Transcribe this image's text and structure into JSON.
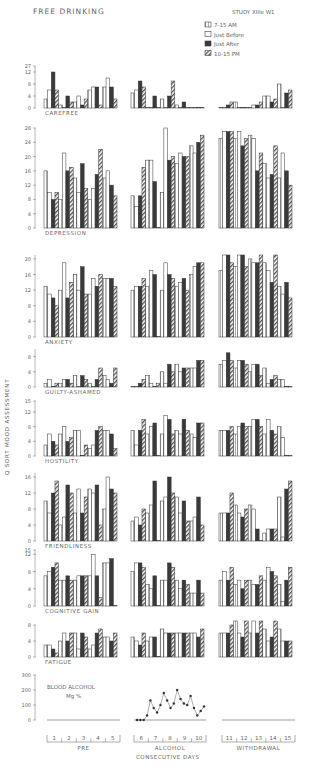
{
  "title": "FREE DRINKING",
  "study_label": "STUDY XIIIe W1",
  "y_axis_label": "Q SORT MOOD ASSESSMENT",
  "legend": [
    {
      "label": "7-15 AM",
      "style": "dotted"
    },
    {
      "label": "Just Before",
      "style": "open"
    },
    {
      "label": "Just After",
      "style": "solid"
    },
    {
      "label": "10-15 PM",
      "style": "hatched"
    }
  ],
  "phases": [
    {
      "label": "PRE",
      "days": [
        "1",
        "2",
        "3",
        "4",
        "5"
      ]
    },
    {
      "label": "ALCOHOL",
      "days": [
        "6",
        "7",
        "8",
        "9",
        "10"
      ]
    },
    {
      "label": "WITHDRAWAL",
      "days": [
        "11",
        "12",
        "13",
        "14",
        "15"
      ]
    }
  ],
  "x_axis_label": "CONSECUTIVE DAYS",
  "blood_alcohol": {
    "label": "BLOOD ALCOHOL",
    "unit": "Mg %",
    "ticks": [
      "0",
      "100",
      "200",
      "300"
    ]
  },
  "chart_data": {
    "type": "bar",
    "title": "FREE DRINKING",
    "ylabel": "Q SORT MOOD ASSESSMENT",
    "xlabel": "CONSECUTIVE DAYS",
    "series_names": [
      "7-15 AM",
      "Just Before",
      "Just After",
      "10-15 PM"
    ],
    "categories": [
      "1",
      "2",
      "3",
      "4",
      "5",
      "6",
      "7",
      "8",
      "9",
      "10",
      "11",
      "12",
      "13",
      "14",
      "15"
    ],
    "panels": [
      {
        "name": "CAREFREE",
        "ticks": [
          "0",
          "4",
          "8",
          "12",
          "27"
        ],
        "ylim": [
          0,
          14
        ],
        "values": [
          [
            3,
            6,
            12,
            6
          ],
          [
            1,
            0,
            4,
            2
          ],
          [
            2,
            4,
            1,
            3
          ],
          [
            6,
            7,
            7,
            1
          ],
          [
            7,
            10,
            7,
            3
          ],
          [
            5,
            6,
            9,
            7
          ],
          [
            0,
            0,
            4,
            0
          ],
          [
            3,
            0,
            4,
            9
          ],
          [
            1,
            0,
            2,
            0
          ],
          [
            0,
            0,
            0,
            0
          ],
          [
            0,
            0,
            1,
            2
          ],
          [
            2,
            0,
            0,
            0
          ],
          [
            0,
            1,
            1,
            2
          ],
          [
            4,
            4,
            2,
            3
          ],
          [
            8,
            0,
            5,
            6
          ]
        ]
      },
      {
        "name": "DEPRESSION",
        "ticks": [
          "0",
          "4",
          "8",
          "12",
          "16",
          "20",
          "24",
          "28"
        ],
        "ylim": [
          0,
          28
        ],
        "values": [
          [
            16,
            10,
            8,
            10
          ],
          [
            8,
            21,
            16,
            17
          ],
          [
            14,
            10,
            18,
            11
          ],
          [
            8,
            11,
            15,
            22
          ],
          [
            14,
            16,
            12,
            9
          ],
          [
            9,
            6,
            9,
            17
          ],
          [
            19,
            19,
            13,
            0
          ],
          [
            10,
            28,
            19,
            20
          ],
          [
            18,
            21,
            20,
            20
          ],
          [
            23,
            21,
            24,
            26
          ],
          [
            25,
            27,
            27,
            27
          ],
          [
            25,
            27,
            23,
            25
          ],
          [
            26,
            25,
            16,
            21
          ],
          [
            18,
            14,
            15,
            23
          ],
          [
            14,
            21,
            16,
            12
          ]
        ]
      },
      {
        "name": "ANXIETY",
        "ticks": [
          "0",
          "4",
          "8",
          "12",
          "16",
          "20"
        ],
        "ylim": [
          0,
          21
        ],
        "values": [
          [
            13,
            11,
            10,
            8
          ],
          [
            12,
            19,
            10,
            14
          ],
          [
            16,
            12,
            18,
            11
          ],
          [
            11,
            15,
            13,
            16
          ],
          [
            15,
            15,
            15,
            13
          ],
          [
            12,
            13,
            13,
            15
          ],
          [
            13,
            17,
            16,
            0
          ],
          [
            12,
            19,
            16,
            15
          ],
          [
            13,
            14,
            15,
            12
          ],
          [
            16,
            18,
            19,
            19
          ],
          [
            17,
            21,
            21,
            19
          ],
          [
            18,
            21,
            21,
            18
          ],
          [
            20,
            19,
            19,
            21
          ],
          [
            19,
            17,
            14,
            21
          ],
          [
            13,
            11,
            14,
            10
          ]
        ]
      },
      {
        "name": "GUILTY-ASHAMED",
        "ticks": [
          "0",
          "4",
          "8"
        ],
        "ylim": [
          0,
          10
        ],
        "values": [
          [
            1,
            2,
            0,
            1
          ],
          [
            1,
            2,
            2,
            1
          ],
          [
            3,
            0,
            3,
            2
          ],
          [
            1,
            0,
            2,
            5
          ],
          [
            3,
            2,
            1,
            5
          ],
          [
            0,
            0,
            1,
            2
          ],
          [
            3,
            1,
            0,
            1
          ],
          [
            4,
            1,
            6,
            4
          ],
          [
            6,
            4,
            5,
            5
          ],
          [
            5,
            5,
            7,
            7
          ],
          [
            6,
            7,
            9,
            7
          ],
          [
            5,
            7,
            7,
            6
          ],
          [
            4,
            6,
            6,
            3
          ],
          [
            5,
            1,
            2,
            3
          ],
          [
            2,
            2,
            0,
            0
          ]
        ]
      },
      {
        "name": "HOSTILITY",
        "ticks": [
          "0",
          "4",
          "8",
          "12",
          "15"
        ],
        "ylim": [
          0,
          15
        ],
        "values": [
          [
            3,
            6,
            4,
            3
          ],
          [
            6,
            8,
            4,
            5
          ],
          [
            7,
            7,
            0,
            3
          ],
          [
            2,
            3,
            7,
            8
          ],
          [
            7,
            7,
            6,
            2
          ],
          [
            7,
            3,
            7,
            10
          ],
          [
            6,
            8,
            9,
            0
          ],
          [
            6,
            11,
            10,
            6
          ],
          [
            7,
            6,
            10,
            7
          ],
          [
            6,
            5,
            9,
            9
          ],
          [
            7,
            7,
            7,
            8
          ],
          [
            6,
            8,
            9,
            8
          ],
          [
            8,
            10,
            10,
            8
          ],
          [
            6,
            10,
            7,
            6
          ],
          [
            8,
            5,
            0,
            0
          ]
        ]
      },
      {
        "name": "FRIENDLINESS",
        "ticks": [
          "0",
          "4",
          "8",
          "12",
          "16"
        ],
        "ylim": [
          0,
          17
        ],
        "values": [
          [
            10,
            7,
            12,
            15
          ],
          [
            4,
            6,
            14,
            12
          ],
          [
            7,
            13,
            7,
            11
          ],
          [
            13,
            12,
            14,
            4
          ],
          [
            8,
            16,
            13,
            12
          ],
          [
            5,
            6,
            4,
            8
          ],
          [
            7,
            9,
            15,
            0
          ],
          [
            10,
            11,
            16,
            12
          ],
          [
            11,
            7,
            10,
            5
          ],
          [
            5,
            6,
            11,
            4
          ],
          [
            7,
            7,
            7,
            12
          ],
          [
            9,
            7,
            6,
            8
          ],
          [
            9,
            8,
            3,
            0
          ],
          [
            2,
            3,
            3,
            3
          ],
          [
            11,
            1,
            13,
            15
          ]
        ]
      },
      {
        "name": "COGNITIVE GAIN",
        "ticks": [
          "0",
          "4",
          "8",
          "12",
          "15"
        ],
        "ylim": [
          0,
          13
        ],
        "values": [
          [
            7,
            8,
            9,
            10
          ],
          [
            6,
            6,
            7,
            6
          ],
          [
            6,
            7,
            7,
            7
          ],
          [
            7,
            12,
            7,
            2
          ],
          [
            10,
            10,
            11,
            0
          ],
          [
            8,
            10,
            10,
            9
          ],
          [
            5,
            4,
            7,
            0
          ],
          [
            6,
            6,
            10,
            9
          ],
          [
            6,
            4,
            6,
            5
          ],
          [
            3,
            3,
            6,
            3
          ],
          [
            6,
            8,
            6,
            9
          ],
          [
            5,
            6,
            4,
            6
          ],
          [
            6,
            5,
            5,
            7
          ],
          [
            6,
            9,
            8,
            7
          ],
          [
            5,
            1,
            6,
            9
          ]
        ]
      },
      {
        "name": "FATIGUE",
        "ticks": [
          "0",
          "4",
          "8"
        ],
        "ylim": [
          0,
          8
        ],
        "values": [
          [
            3,
            3,
            2,
            1
          ],
          [
            4,
            6,
            4,
            6
          ],
          [
            6,
            2,
            6,
            5
          ],
          [
            2,
            3,
            6,
            7
          ],
          [
            5,
            5,
            4,
            6
          ],
          [
            5,
            4,
            3,
            6
          ],
          [
            4,
            5,
            5,
            0
          ],
          [
            7,
            6,
            6,
            6
          ],
          [
            6,
            6,
            6,
            6
          ],
          [
            6,
            6,
            5,
            7
          ],
          [
            6,
            6,
            6,
            8
          ],
          [
            9,
            6,
            5,
            9
          ],
          [
            6,
            9,
            6,
            9
          ],
          [
            7,
            4,
            5,
            9
          ],
          [
            7,
            4,
            4,
            4
          ]
        ]
      }
    ],
    "blood_alcohol_line": {
      "unit": "Mg %",
      "ylim": [
        0,
        300
      ],
      "points_days_6_to_10": [
        0,
        0,
        0,
        30,
        130,
        80,
        50,
        100,
        180,
        130,
        80,
        110,
        200,
        140,
        110,
        100,
        160,
        80,
        30,
        60,
        90
      ]
    }
  }
}
